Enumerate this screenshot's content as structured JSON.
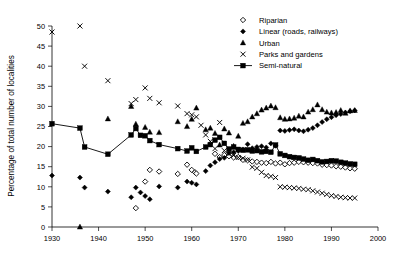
{
  "chart_data": {
    "type": "scatter",
    "title": "",
    "xlabel": "",
    "ylabel": "Percentage of total number of localities",
    "xlim": [
      1930,
      2000
    ],
    "ylim": [
      0,
      50
    ],
    "xticks": [
      1930,
      1940,
      1950,
      1960,
      1970,
      1980,
      1990,
      2000
    ],
    "yticks": [
      0,
      5,
      10,
      15,
      20,
      25,
      30,
      35,
      40,
      45,
      50
    ],
    "grid": false,
    "legend_position": "top-right",
    "series": [
      {
        "name": "Riparian",
        "marker": "open-diamond",
        "line": false,
        "color": "#000000",
        "points": [
          [
            1948,
            4.7
          ],
          [
            1950,
            11.3
          ],
          [
            1951,
            14.2
          ],
          [
            1953,
            13.8
          ],
          [
            1957,
            13.2
          ],
          [
            1959,
            15.5
          ],
          [
            1960,
            14.2
          ],
          [
            1960.7,
            13.6
          ],
          [
            1961,
            13.3
          ],
          [
            1965,
            18.2
          ],
          [
            1966,
            17.4
          ],
          [
            1967,
            17.9
          ],
          [
            1968,
            17.6
          ],
          [
            1969,
            17.3
          ],
          [
            1970,
            17.4
          ],
          [
            1971,
            16.7
          ],
          [
            1972,
            16.6
          ],
          [
            1973,
            16.3
          ],
          [
            1974,
            16.2
          ],
          [
            1975,
            16.0
          ],
          [
            1976,
            15.9
          ],
          [
            1977,
            16.2
          ],
          [
            1978,
            15.8
          ],
          [
            1979,
            16.0
          ],
          [
            1980,
            15.6
          ],
          [
            1981,
            15.9
          ],
          [
            1982,
            16.0
          ],
          [
            1983,
            16.2
          ],
          [
            1984,
            16.1
          ],
          [
            1985,
            16.0
          ],
          [
            1986,
            15.9
          ],
          [
            1987,
            15.8
          ],
          [
            1988,
            15.5
          ],
          [
            1989,
            15.4
          ],
          [
            1990,
            15.3
          ],
          [
            1991,
            15.1
          ],
          [
            1992,
            15.0
          ],
          [
            1993,
            14.8
          ],
          [
            1994,
            14.6
          ],
          [
            1995,
            14.5
          ]
        ]
      },
      {
        "name": "Linear (roads, railways)",
        "marker": "filled-diamond",
        "line": false,
        "color": "#000000",
        "points": [
          [
            1930,
            12.8
          ],
          [
            1936,
            12.3
          ],
          [
            1937,
            9.8
          ],
          [
            1942,
            8.8
          ],
          [
            1947,
            7.4
          ],
          [
            1948,
            9.8
          ],
          [
            1949,
            8.6
          ],
          [
            1950,
            7.7
          ],
          [
            1951,
            6.9
          ],
          [
            1953,
            10.1
          ],
          [
            1957,
            9.8
          ],
          [
            1959,
            11.3
          ],
          [
            1960,
            11.0
          ],
          [
            1961,
            10.6
          ],
          [
            1963,
            13.9
          ],
          [
            1964,
            15.3
          ],
          [
            1965,
            16.1
          ],
          [
            1966,
            16.9
          ],
          [
            1967,
            17.2
          ],
          [
            1968,
            18.4
          ],
          [
            1969,
            18.6
          ],
          [
            1970,
            18.9
          ],
          [
            1971,
            19.3
          ],
          [
            1972,
            20.6
          ],
          [
            1973,
            19.6
          ],
          [
            1974,
            19.9
          ],
          [
            1975,
            20.1
          ],
          [
            1976,
            19.8
          ],
          [
            1977,
            20.8
          ],
          [
            1978,
            20.2
          ],
          [
            1979,
            24.0
          ],
          [
            1980,
            23.9
          ],
          [
            1981,
            24.1
          ],
          [
            1982,
            24.3
          ],
          [
            1983,
            24.0
          ],
          [
            1984,
            23.8
          ],
          [
            1985,
            24.2
          ],
          [
            1986,
            24.6
          ],
          [
            1987,
            25.3
          ],
          [
            1988,
            26.1
          ],
          [
            1989,
            26.8
          ],
          [
            1990,
            27.3
          ],
          [
            1991,
            27.8
          ],
          [
            1992,
            28.1
          ],
          [
            1993,
            28.5
          ],
          [
            1994,
            28.8
          ],
          [
            1995,
            29.0
          ]
        ]
      },
      {
        "name": "Urban",
        "marker": "filled-triangle",
        "line": false,
        "color": "#000000",
        "points": [
          [
            1936,
            0.0
          ],
          [
            1942,
            26.9
          ],
          [
            1947,
            30.0
          ],
          [
            1948,
            25.6
          ],
          [
            1950,
            24.8
          ],
          [
            1951,
            23.6
          ],
          [
            1953,
            23.5
          ],
          [
            1957,
            26.2
          ],
          [
            1959,
            25.0
          ],
          [
            1960,
            26.8
          ],
          [
            1961,
            29.6
          ],
          [
            1963,
            24.2
          ],
          [
            1964,
            24.6
          ],
          [
            1965,
            23.3
          ],
          [
            1966,
            20.4
          ],
          [
            1967,
            24.4
          ],
          [
            1968,
            23.4
          ],
          [
            1969,
            20.1
          ],
          [
            1970,
            22.6
          ],
          [
            1971,
            25.8
          ],
          [
            1972,
            26.2
          ],
          [
            1973,
            27.4
          ],
          [
            1974,
            28.2
          ],
          [
            1975,
            29.1
          ],
          [
            1976,
            29.6
          ],
          [
            1977,
            30.1
          ],
          [
            1978,
            29.7
          ],
          [
            1979,
            27.2
          ],
          [
            1980,
            26.8
          ],
          [
            1981,
            26.9
          ],
          [
            1982,
            27.1
          ],
          [
            1983,
            27.6
          ],
          [
            1984,
            27.4
          ],
          [
            1985,
            28.6
          ],
          [
            1986,
            29.2
          ],
          [
            1987,
            30.4
          ],
          [
            1988,
            29.2
          ],
          [
            1989,
            28.6
          ],
          [
            1990,
            28.4
          ],
          [
            1991,
            28.5
          ],
          [
            1992,
            29.0
          ],
          [
            1993,
            28.3
          ],
          [
            1994,
            28.9
          ],
          [
            1995,
            29.0
          ]
        ]
      },
      {
        "name": "Parks and gardens",
        "marker": "cross-x",
        "line": false,
        "color": "#000000",
        "points": [
          [
            1930,
            48.5
          ],
          [
            1936,
            50.0
          ],
          [
            1937,
            40.0
          ],
          [
            1942,
            36.4
          ],
          [
            1947,
            30.7
          ],
          [
            1948,
            31.7
          ],
          [
            1950,
            34.6
          ],
          [
            1951,
            32.0
          ],
          [
            1953,
            30.9
          ],
          [
            1957,
            30.1
          ],
          [
            1959,
            28.2
          ],
          [
            1960,
            27.9
          ],
          [
            1961,
            27.4
          ],
          [
            1962,
            25.3
          ],
          [
            1963,
            22.9
          ],
          [
            1964,
            21.3
          ],
          [
            1965,
            19.5
          ],
          [
            1966,
            26.0
          ],
          [
            1967,
            19.0
          ],
          [
            1968,
            18.3
          ],
          [
            1969,
            17.8
          ],
          [
            1970,
            17.3
          ],
          [
            1971,
            17.1
          ],
          [
            1972,
            16.7
          ],
          [
            1973,
            14.9
          ],
          [
            1974,
            14.6
          ],
          [
            1975,
            13.6
          ],
          [
            1976,
            12.8
          ],
          [
            1977,
            12.6
          ],
          [
            1978,
            12.3
          ],
          [
            1979,
            10.0
          ],
          [
            1980,
            9.9
          ],
          [
            1981,
            9.8
          ],
          [
            1982,
            9.7
          ],
          [
            1983,
            9.6
          ],
          [
            1984,
            9.4
          ],
          [
            1985,
            9.3
          ],
          [
            1986,
            9.0
          ],
          [
            1987,
            8.7
          ],
          [
            1988,
            8.4
          ],
          [
            1989,
            8.1
          ],
          [
            1990,
            7.8
          ],
          [
            1991,
            7.6
          ],
          [
            1992,
            7.4
          ],
          [
            1993,
            7.3
          ],
          [
            1994,
            7.2
          ],
          [
            1995,
            7.2
          ]
        ]
      },
      {
        "name": "Semi-natural",
        "marker": "filled-square",
        "line": true,
        "color": "#000000",
        "points": [
          [
            1930,
            25.7
          ],
          [
            1936,
            24.6
          ],
          [
            1937,
            19.9
          ],
          [
            1942,
            18.1
          ],
          [
            1947,
            22.9
          ],
          [
            1948,
            24.5
          ],
          [
            1949,
            22.8
          ],
          [
            1950,
            22.7
          ],
          [
            1951,
            21.5
          ],
          [
            1953,
            20.5
          ],
          [
            1957,
            19.5
          ],
          [
            1959,
            18.9
          ],
          [
            1960,
            19.7
          ],
          [
            1961,
            18.8
          ],
          [
            1963,
            19.9
          ],
          [
            1964,
            20.5
          ],
          [
            1965,
            21.6
          ],
          [
            1966,
            22.3
          ],
          [
            1967,
            20.8
          ],
          [
            1968,
            19.4
          ],
          [
            1969,
            19.9
          ],
          [
            1970,
            19.3
          ],
          [
            1971,
            19.1
          ],
          [
            1972,
            19.2
          ],
          [
            1973,
            18.9
          ],
          [
            1974,
            19.0
          ],
          [
            1975,
            18.7
          ],
          [
            1976,
            18.8
          ],
          [
            1977,
            18.6
          ],
          [
            1978,
            20.4
          ],
          [
            1979,
            18.2
          ],
          [
            1980,
            17.8
          ],
          [
            1981,
            17.5
          ],
          [
            1982,
            17.3
          ],
          [
            1983,
            17.2
          ],
          [
            1984,
            16.9
          ],
          [
            1985,
            16.6
          ],
          [
            1986,
            16.8
          ],
          [
            1987,
            16.5
          ],
          [
            1988,
            16.2
          ],
          [
            1989,
            16.3
          ],
          [
            1990,
            16.5
          ],
          [
            1991,
            16.4
          ],
          [
            1992,
            16.1
          ],
          [
            1993,
            15.9
          ],
          [
            1994,
            15.7
          ],
          [
            1995,
            15.6
          ]
        ]
      }
    ]
  }
}
